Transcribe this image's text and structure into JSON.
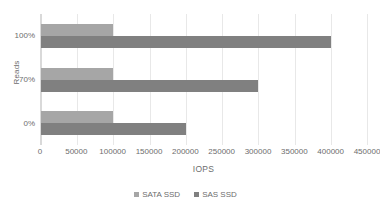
{
  "chart_data": {
    "type": "bar",
    "orientation": "horizontal",
    "title": "",
    "xlabel": "IOPS",
    "ylabel": "Reads",
    "categories": [
      "0%",
      "70%",
      "100%"
    ],
    "categories_display_top_to_bottom": [
      "100%",
      "70%",
      "0%"
    ],
    "series": [
      {
        "name": "SATA SSD",
        "color": "#a6a6a6",
        "values": [
          100000,
          100000,
          100000
        ]
      },
      {
        "name": "SAS SSD",
        "color": "#808080",
        "values": [
          200000,
          300000,
          400000
        ]
      }
    ],
    "xlim": [
      0,
      450000
    ],
    "xticks": [
      0,
      50000,
      100000,
      150000,
      200000,
      250000,
      300000,
      350000,
      400000,
      450000
    ],
    "xtick_labels": [
      "0",
      "50000",
      "100000",
      "150000",
      "200000",
      "250000",
      "300000",
      "350000",
      "400000",
      "450000"
    ],
    "grid": "vertical",
    "legend_position": "bottom",
    "rows_top_to_bottom": [
      {
        "category": "100%",
        "sata_ssd": 100000,
        "sas_ssd": 400000
      },
      {
        "category": "70%",
        "sata_ssd": 100000,
        "sas_ssd": 300000
      },
      {
        "category": "0%",
        "sata_ssd": 100000,
        "sas_ssd": 200000
      }
    ]
  },
  "axes": {
    "y_title": "Reads",
    "x_title": "IOPS",
    "y_categories": [
      "100%",
      "70%",
      "0%"
    ],
    "x_tick_labels": [
      "0",
      "50000",
      "100000",
      "150000",
      "200000",
      "250000",
      "300000",
      "350000",
      "400000",
      "450000"
    ]
  },
  "legend": {
    "items": [
      {
        "label": "SATA SSD",
        "color": "#a6a6a6"
      },
      {
        "label": "SAS SSD",
        "color": "#808080"
      }
    ]
  },
  "colors": {
    "series_sata": "#a6a6a6",
    "series_sas": "#808080",
    "gridline": "#e8e8e8",
    "axis_line": "#d9d9d9",
    "text": "#6d6d6d",
    "background": "#ffffff"
  }
}
